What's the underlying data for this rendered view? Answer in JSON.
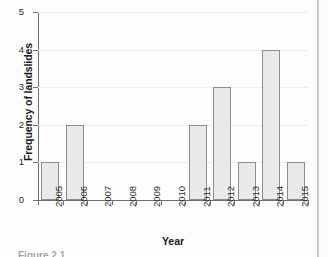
{
  "chart_data": {
    "type": "bar",
    "title": "",
    "xlabel": "Year",
    "ylabel": "Frequency of landslides",
    "categories": [
      "2005",
      "2006",
      "2007",
      "2008",
      "2009",
      "2010",
      "2011",
      "2012",
      "2013",
      "2014",
      "2015"
    ],
    "values": [
      1,
      2,
      0,
      0,
      0,
      0,
      2,
      3,
      1,
      4,
      1
    ],
    "ylim": [
      0,
      5
    ],
    "yticks": [
      0,
      1,
      2,
      3,
      4,
      5
    ],
    "ytick_labels": [
      "0",
      "1",
      "2",
      "3",
      "4",
      "5"
    ],
    "grid": true,
    "grid_axis": "y",
    "legend": "none",
    "bar_fill": "#e9e9e9",
    "bar_edge": "#8c8c8c",
    "axis_color": "#6f6f6f",
    "grid_color": "#ededed",
    "background": "#fdfdfd"
  },
  "caption": {
    "text": "Figure 2.1"
  }
}
